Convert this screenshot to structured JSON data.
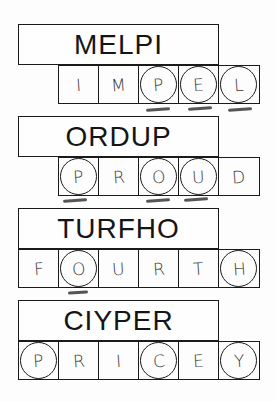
{
  "puzzles": [
    {
      "scrambled": "MELPI",
      "row_offset": 58,
      "top": 24,
      "letters": [
        "I",
        "M",
        "P",
        "E",
        "L"
      ],
      "circled": [
        false,
        false,
        true,
        true,
        true
      ],
      "marked": [
        false,
        false,
        true,
        true,
        true
      ]
    },
    {
      "scrambled": "ORDUP",
      "row_offset": 58,
      "top": 116,
      "letters": [
        "P",
        "R",
        "O",
        "U",
        "D"
      ],
      "circled": [
        true,
        false,
        true,
        true,
        false
      ],
      "marked": [
        true,
        false,
        true,
        true,
        false
      ]
    },
    {
      "scrambled": "TURFHO",
      "row_offset": 18,
      "top": 208,
      "letters": [
        "F",
        "O",
        "U",
        "R",
        "T",
        "H"
      ],
      "circled": [
        false,
        true,
        false,
        false,
        false,
        true
      ],
      "marked": [
        false,
        true,
        false,
        false,
        false,
        false
      ]
    },
    {
      "scrambled": "CIYPER",
      "row_offset": 18,
      "top": 300,
      "letters": [
        "P",
        "R",
        "I",
        "C",
        "E",
        "Y"
      ],
      "circled": [
        true,
        false,
        false,
        true,
        false,
        true
      ],
      "marked": [
        false,
        false,
        false,
        false,
        false,
        false
      ]
    }
  ]
}
